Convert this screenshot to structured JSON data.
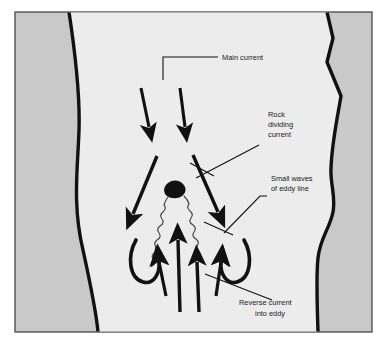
{
  "figure": {
    "colors": {
      "bank_fill": "#c9c9c9",
      "water_fill": "#ececec",
      "ink": "#111111",
      "page": "#ffffff",
      "border": "#3a3a3a"
    },
    "labels": [
      {
        "id": "main-current",
        "lines": [
          "Main current"
        ],
        "x": 222,
        "y": 57
      },
      {
        "id": "rock-dividing-current",
        "lines": [
          "Rock",
          "dividing",
          "current"
        ],
        "x": 268,
        "y": 122
      },
      {
        "id": "small-waves-of-eddy-line",
        "lines": [
          "Small waves",
          "of eddy line"
        ],
        "x": 271,
        "y": 181
      },
      {
        "id": "reverse-current-into-eddy",
        "lines": [
          "Reverse current",
          "into eddy"
        ],
        "x": 278,
        "y": 305
      }
    ],
    "features": {
      "rock": "irregular black blob dividing the current",
      "eddy_lines": "two wavy lines forming a V below the rock",
      "main_current_arrows": 2,
      "diverging_arrows": 2,
      "reverse_current_arrows": 4,
      "recirculation_curls": 2
    }
  }
}
